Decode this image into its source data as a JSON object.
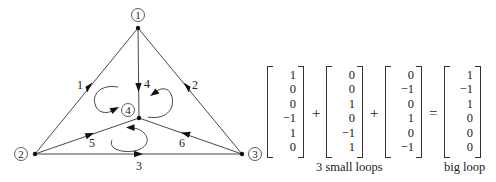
{
  "graph": {
    "nodes": [
      {
        "id": 1,
        "label": "1",
        "x": 138,
        "y": 28,
        "label_x": 138,
        "label_y": 15
      },
      {
        "id": 2,
        "label": "2",
        "x": 35,
        "y": 154,
        "label_x": 21,
        "label_y": 154
      },
      {
        "id": 3,
        "label": "3",
        "x": 242,
        "y": 154,
        "label_x": 255,
        "label_y": 154
      },
      {
        "id": 4,
        "label": "4",
        "x": 139,
        "y": 118,
        "label_x": 128,
        "label_y": 110
      }
    ],
    "edges": [
      {
        "id": 1,
        "label": "1",
        "from": 1,
        "to": 2,
        "label_x": 80,
        "label_y": 89
      },
      {
        "id": 2,
        "label": "2",
        "from": 1,
        "to": 3,
        "label_x": 195,
        "label_y": 89
      },
      {
        "id": 3,
        "label": "3",
        "from": 2,
        "to": 3,
        "label_x": 139,
        "label_y": 170
      },
      {
        "id": 4,
        "label": "4",
        "from": 1,
        "to": 4,
        "label_x": 147,
        "label_y": 88
      },
      {
        "id": 5,
        "label": "5",
        "from": 2,
        "to": 4,
        "label_x": 92,
        "label_y": 147
      },
      {
        "id": 6,
        "label": "6",
        "from": 3,
        "to": 4,
        "label_x": 182,
        "label_y": 147
      }
    ],
    "loops": [
      {
        "name": "left-loop",
        "direction": "counterclockwise"
      },
      {
        "name": "right-loop",
        "direction": "clockwise"
      },
      {
        "name": "bottom-loop",
        "direction": "counterclockwise"
      }
    ]
  },
  "equation": {
    "vectors": [
      {
        "name": "small-loop-1",
        "values": [
          "1",
          "0",
          "0",
          "−1",
          "1",
          "0"
        ]
      },
      {
        "name": "small-loop-2",
        "values": [
          "0",
          "0",
          "1",
          "0",
          "−1",
          "1"
        ]
      },
      {
        "name": "small-loop-3",
        "values": [
          "0",
          "−1",
          "0",
          "1",
          "0",
          "−1"
        ]
      },
      {
        "name": "big-loop",
        "values": [
          "1",
          "−1",
          "1",
          "0",
          "0",
          "0"
        ]
      }
    ],
    "operators": [
      "+",
      "+",
      "="
    ],
    "captions": {
      "small_loops": "3 small loops",
      "big_loop": "big loop"
    }
  }
}
